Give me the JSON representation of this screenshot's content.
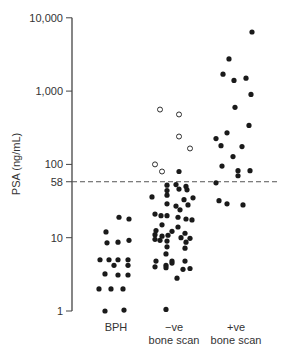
{
  "chart_data": {
    "type": "scatter",
    "title": "",
    "xlabel": "",
    "ylabel": "PSA (ng/mL)",
    "yscale": "log",
    "ylim": [
      1,
      10000
    ],
    "yticks": [
      {
        "value": 10000,
        "label": "10,000"
      },
      {
        "value": 1000,
        "label": "1,000"
      },
      {
        "value": 100,
        "label": "100"
      },
      {
        "value": 58,
        "label": "58"
      },
      {
        "value": 10,
        "label": "10"
      },
      {
        "value": 1,
        "label": "1"
      }
    ],
    "categories": [
      {
        "key": "bph",
        "label_lines": [
          "BPH"
        ]
      },
      {
        "key": "neg",
        "label_lines": [
          "−ve",
          "bone scan"
        ]
      },
      {
        "key": "pos",
        "label_lines": [
          "+ve",
          "bone scan"
        ]
      }
    ],
    "reference_line": {
      "value": 58,
      "style": "dashed"
    },
    "grid": false,
    "series": [
      {
        "name": "BPH",
        "marker": "filled",
        "points": [
          {
            "x": 119,
            "v": 19
          },
          {
            "x": 129,
            "v": 18
          },
          {
            "x": 106,
            "v": 12
          },
          {
            "x": 107,
            "v": 8.5
          },
          {
            "x": 118,
            "v": 8.7
          },
          {
            "x": 129,
            "v": 9.2
          },
          {
            "x": 100,
            "v": 5
          },
          {
            "x": 109,
            "v": 5
          },
          {
            "x": 118,
            "v": 5
          },
          {
            "x": 128,
            "v": 5
          },
          {
            "x": 114,
            "v": 4.2
          },
          {
            "x": 128,
            "v": 4.2
          },
          {
            "x": 105,
            "v": 3.2
          },
          {
            "x": 118,
            "v": 3.1
          },
          {
            "x": 128,
            "v": 3.1
          },
          {
            "x": 99,
            "v": 2
          },
          {
            "x": 111,
            "v": 2
          },
          {
            "x": 123,
            "v": 2
          },
          {
            "x": 105,
            "v": 1
          },
          {
            "x": 124,
            "v": 1.03
          }
        ]
      },
      {
        "name": "−ve bone scan (filled)",
        "marker": "filled",
        "points": [
          {
            "x": 179,
            "v": 80
          },
          {
            "x": 167,
            "v": 52
          },
          {
            "x": 176,
            "v": 53
          },
          {
            "x": 186,
            "v": 50
          },
          {
            "x": 167,
            "v": 44
          },
          {
            "x": 179,
            "v": 46
          },
          {
            "x": 187,
            "v": 45
          },
          {
            "x": 152,
            "v": 36
          },
          {
            "x": 167,
            "v": 38
          },
          {
            "x": 184,
            "v": 33
          },
          {
            "x": 193,
            "v": 35
          },
          {
            "x": 167,
            "v": 29
          },
          {
            "x": 176,
            "v": 27
          },
          {
            "x": 188,
            "v": 28
          },
          {
            "x": 180,
            "v": 24
          },
          {
            "x": 155,
            "v": 21
          },
          {
            "x": 161,
            "v": 20
          },
          {
            "x": 167,
            "v": 20
          },
          {
            "x": 178,
            "v": 19
          },
          {
            "x": 186,
            "v": 18
          },
          {
            "x": 192,
            "v": 17.5
          },
          {
            "x": 162,
            "v": 15
          },
          {
            "x": 178,
            "v": 14
          },
          {
            "x": 156,
            "v": 12.5
          },
          {
            "x": 172,
            "v": 12.2
          },
          {
            "x": 185,
            "v": 11.5
          },
          {
            "x": 155,
            "v": 11
          },
          {
            "x": 162,
            "v": 10.5
          },
          {
            "x": 168,
            "v": 10.8
          },
          {
            "x": 181,
            "v": 10
          },
          {
            "x": 190,
            "v": 9.8
          },
          {
            "x": 155,
            "v": 9.5
          },
          {
            "x": 160,
            "v": 9.2
          },
          {
            "x": 167,
            "v": 9
          },
          {
            "x": 186,
            "v": 8.7
          },
          {
            "x": 167,
            "v": 7.5
          },
          {
            "x": 185,
            "v": 7.2
          },
          {
            "x": 166,
            "v": 6
          },
          {
            "x": 156,
            "v": 4.8
          },
          {
            "x": 172,
            "v": 4.8
          },
          {
            "x": 166,
            "v": 4.2
          },
          {
            "x": 172,
            "v": 4.5
          },
          {
            "x": 185,
            "v": 4.8
          },
          {
            "x": 155,
            "v": 4
          },
          {
            "x": 166,
            "v": 3.9
          },
          {
            "x": 183,
            "v": 3.7
          },
          {
            "x": 190,
            "v": 3.8
          },
          {
            "x": 177,
            "v": 2.8
          },
          {
            "x": 166,
            "v": 1.05
          }
        ]
      },
      {
        "name": "−ve bone scan (open)",
        "marker": "open",
        "points": [
          {
            "x": 160,
            "v": 560
          },
          {
            "x": 179,
            "v": 480
          },
          {
            "x": 179,
            "v": 240
          },
          {
            "x": 190,
            "v": 165
          },
          {
            "x": 155,
            "v": 100
          },
          {
            "x": 162,
            "v": 80
          }
        ]
      },
      {
        "name": "+ve bone scan",
        "marker": "filled",
        "points": [
          {
            "x": 252,
            "v": 6400
          },
          {
            "x": 229,
            "v": 2750
          },
          {
            "x": 223,
            "v": 1700
          },
          {
            "x": 246,
            "v": 1500
          },
          {
            "x": 234,
            "v": 1400
          },
          {
            "x": 251,
            "v": 900
          },
          {
            "x": 235,
            "v": 600
          },
          {
            "x": 249,
            "v": 340
          },
          {
            "x": 227,
            "v": 270
          },
          {
            "x": 216,
            "v": 225
          },
          {
            "x": 221,
            "v": 180
          },
          {
            "x": 242,
            "v": 175
          },
          {
            "x": 233,
            "v": 128
          },
          {
            "x": 222,
            "v": 95
          },
          {
            "x": 238,
            "v": 82
          },
          {
            "x": 250,
            "v": 82
          },
          {
            "x": 238,
            "v": 70
          },
          {
            "x": 216,
            "v": 56
          },
          {
            "x": 219,
            "v": 32
          },
          {
            "x": 227,
            "v": 29
          },
          {
            "x": 243,
            "v": 28
          }
        ]
      }
    ]
  },
  "axis": {
    "ylabel": "PSA (ng/mL)"
  },
  "colors": {
    "dot": "#1a1a1a",
    "axis": "#444444",
    "text": "#333333",
    "dashed_line": "#555555",
    "background": "#ffffff"
  }
}
